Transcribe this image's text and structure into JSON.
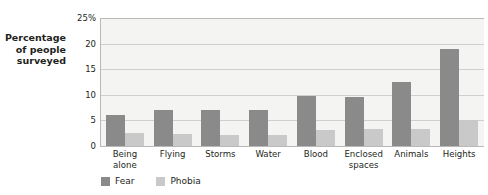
{
  "chart_data": {
    "type": "bar",
    "title": "",
    "xlabel": "",
    "ylabel": "Percentage of people surveyed",
    "ylabel_lines": [
      "Percentage",
      "of people",
      "surveyed"
    ],
    "categories": [
      "Being alone",
      "Flying",
      "Storms",
      "Water",
      "Blood",
      "Enclosed spaces",
      "Animals",
      "Heights"
    ],
    "category_lines": [
      [
        "Being",
        "alone"
      ],
      [
        "Flying"
      ],
      [
        "Storms"
      ],
      [
        "Water"
      ],
      [
        "Blood"
      ],
      [
        "Enclosed",
        "spaces"
      ],
      [
        "Animals"
      ],
      [
        "Heights"
      ]
    ],
    "series": [
      {
        "name": "Fear",
        "color": "#8a8a8a",
        "values": [
          6.0,
          7.0,
          7.0,
          7.0,
          9.7,
          9.6,
          12.5,
          19.0
        ]
      },
      {
        "name": "Phobia",
        "color": "#c9c9c9",
        "values": [
          2.6,
          2.4,
          2.2,
          2.2,
          3.1,
          3.4,
          3.3,
          5.0
        ]
      }
    ],
    "ylim": [
      0,
      25
    ],
    "yticks": [
      0,
      5,
      10,
      15,
      20,
      25
    ],
    "ytick_labels": [
      "0",
      "5",
      "10",
      "15",
      "20",
      "25%"
    ],
    "grid": true,
    "legend_position": "bottom-left",
    "legend": [
      "Fear",
      "Phobia"
    ],
    "plot_background": "#f4f4f2",
    "grid_color": "#cfcfcd",
    "axis_color": "#b9b9b7"
  },
  "bleed_text": {
    "line1": "faint show-through text from reverse side",
    "line2": "of the printed page behind the chart",
    "line3": "barely legible ghosted characters",
    "line4": "show-through artifacts"
  }
}
